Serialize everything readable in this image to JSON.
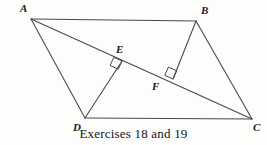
{
  "figure": {
    "caption": "Exercises 18 and 19",
    "stroke_color": "#4a4a4a",
    "label_color": "#1a1a1a",
    "background_color": "#fdfdfb",
    "vertices": [
      {
        "id": "A",
        "label": "A",
        "x": 31,
        "y": 19,
        "label_x": 20,
        "label_y": 3
      },
      {
        "id": "B",
        "label": "B",
        "x": 196,
        "y": 21,
        "label_x": 201,
        "label_y": 5
      },
      {
        "id": "C",
        "label": "C",
        "x": 252,
        "y": 119,
        "label_x": 253,
        "label_y": 122
      },
      {
        "id": "D",
        "label": "D",
        "x": 85,
        "y": 118,
        "label_x": 73,
        "label_y": 122
      },
      {
        "id": "E",
        "label": "E",
        "x": 122,
        "y": 61,
        "label_x": 116,
        "label_y": 44
      },
      {
        "id": "F",
        "label": "F",
        "x": 173,
        "y": 79,
        "label_x": 152,
        "label_y": 81
      }
    ],
    "segments": [
      {
        "name": "side-AB",
        "from": "A",
        "to": "B"
      },
      {
        "name": "side-BC",
        "from": "B",
        "to": "C"
      },
      {
        "name": "side-DC",
        "from": "D",
        "to": "C"
      },
      {
        "name": "side-AD",
        "from": "A",
        "to": "D"
      },
      {
        "name": "diagonal-AC",
        "from": "A",
        "to": "C"
      },
      {
        "name": "altitude-DE",
        "from": "D",
        "to": "E"
      },
      {
        "name": "altitude-BF",
        "from": "B",
        "to": "F"
      }
    ],
    "right_angle_marks": [
      {
        "name": "right-angle-at-E",
        "at": "E",
        "size": 9
      },
      {
        "name": "right-angle-at-F",
        "at": "F",
        "size": 9
      }
    ]
  }
}
